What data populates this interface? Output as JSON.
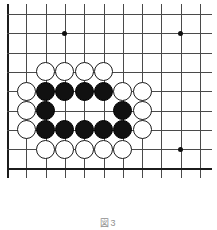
{
  "figure": {
    "kind": "go-board-diagram",
    "caption": "図3",
    "board": {
      "columns": 11,
      "rows": 9,
      "left_px": 7,
      "top_px": 14,
      "cell_px": 19.3,
      "line_color": "#4a4a4a",
      "edge_color": "#1c1c1c",
      "background": "#ffffff"
    },
    "star_points": [
      {
        "col": 3,
        "row": 1
      },
      {
        "col": 9,
        "row": 1
      },
      {
        "col": 9,
        "row": 7
      }
    ],
    "stones": [
      {
        "color": "white",
        "col": 2,
        "row": 3
      },
      {
        "color": "white",
        "col": 3,
        "row": 3
      },
      {
        "color": "white",
        "col": 4,
        "row": 3
      },
      {
        "color": "white",
        "col": 5,
        "row": 3
      },
      {
        "color": "white",
        "col": 1,
        "row": 4
      },
      {
        "color": "black",
        "col": 2,
        "row": 4
      },
      {
        "color": "black",
        "col": 3,
        "row": 4
      },
      {
        "color": "black",
        "col": 4,
        "row": 4
      },
      {
        "color": "black",
        "col": 5,
        "row": 4
      },
      {
        "color": "white",
        "col": 6,
        "row": 4
      },
      {
        "color": "white",
        "col": 7,
        "row": 4
      },
      {
        "color": "white",
        "col": 1,
        "row": 5
      },
      {
        "color": "black",
        "col": 2,
        "row": 5
      },
      {
        "color": "black",
        "col": 6,
        "row": 5
      },
      {
        "color": "white",
        "col": 7,
        "row": 5
      },
      {
        "color": "white",
        "col": 1,
        "row": 6
      },
      {
        "color": "black",
        "col": 2,
        "row": 6
      },
      {
        "color": "black",
        "col": 3,
        "row": 6
      },
      {
        "color": "black",
        "col": 4,
        "row": 6
      },
      {
        "color": "black",
        "col": 5,
        "row": 6
      },
      {
        "color": "black",
        "col": 6,
        "row": 6
      },
      {
        "color": "white",
        "col": 7,
        "row": 6
      },
      {
        "color": "white",
        "col": 2,
        "row": 7
      },
      {
        "color": "white",
        "col": 3,
        "row": 7
      },
      {
        "color": "white",
        "col": 4,
        "row": 7
      },
      {
        "color": "white",
        "col": 5,
        "row": 7
      },
      {
        "color": "white",
        "col": 6,
        "row": 7
      }
    ]
  }
}
